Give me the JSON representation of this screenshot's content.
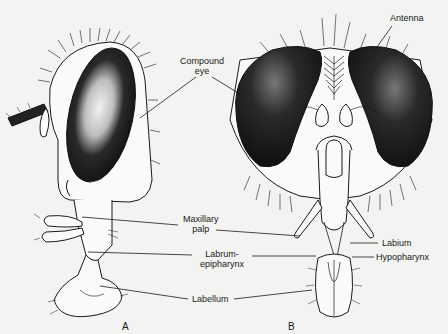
{
  "figure": {
    "panels": [
      {
        "id": "A",
        "label": "A",
        "view": "lateral"
      },
      {
        "id": "B",
        "label": "B",
        "view": "frontal"
      }
    ],
    "labels": {
      "antenna": "Antenna",
      "compound_eye_line1": "Compound",
      "compound_eye_line2": "eye",
      "maxillary_palp_line1": "Maxillary",
      "maxillary_palp_line2": "palp",
      "labrum_line1": "Labrum-",
      "labrum_line2": "epipharynx",
      "labellum": "Labellum",
      "labium": "Labium",
      "hypopharynx": "Hypopharynx"
    },
    "colors": {
      "background": "#f3f3f1",
      "ink": "#1a1a1a",
      "eye_fill": "#141414"
    }
  }
}
